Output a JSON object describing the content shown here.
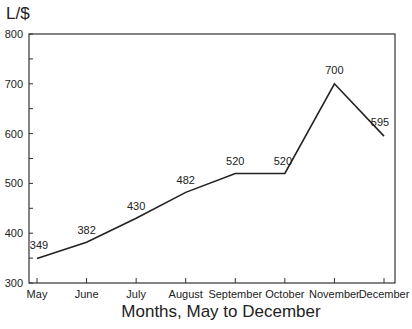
{
  "chart_data": {
    "type": "line",
    "title": "",
    "xlabel": "Months, May to December",
    "ylabel": "L/$",
    "categories": [
      "May",
      "June",
      "July",
      "August",
      "September",
      "October",
      "November",
      "December"
    ],
    "values": [
      349,
      382,
      430,
      482,
      520,
      520,
      700,
      595
    ],
    "data_labels": [
      "349",
      "382",
      "430",
      "482",
      "520",
      "520",
      "700",
      "595"
    ],
    "ylim": [
      300,
      800
    ],
    "yticks": [
      "300",
      "400",
      "500",
      "600",
      "700",
      "800"
    ],
    "grid": false,
    "legend": null
  },
  "colors": {
    "line": "#222222",
    "axis": "#333333",
    "background": "#ffffff"
  }
}
